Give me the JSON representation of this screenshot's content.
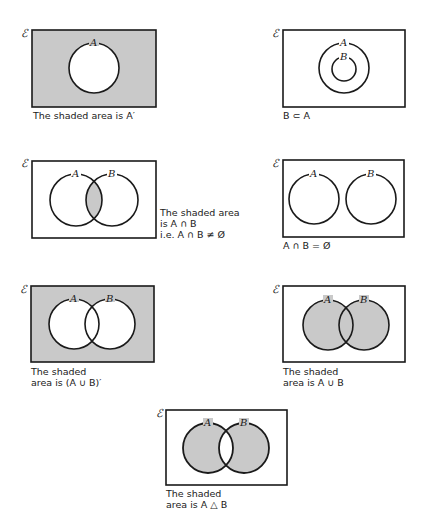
{
  "universal_symbol": "ℰ",
  "colors": {
    "shade": "#c9c9c9",
    "line": "#1a1a1a",
    "background": "#ffffff"
  },
  "diagrams": [
    {
      "id": "complement-A",
      "set_labels": [
        "A"
      ],
      "caption_lines": [
        "The shaded area is A′"
      ]
    },
    {
      "id": "B-subset-A",
      "set_labels": [
        "A",
        "B"
      ],
      "caption_lines": [
        "B ⊂ A"
      ]
    },
    {
      "id": "intersection",
      "set_labels": [
        "A",
        "B"
      ],
      "caption_lines": [
        "The shaded area",
        "is  A ∩ B",
        "i.e.  A ∩ B ≠ Ø"
      ]
    },
    {
      "id": "disjoint",
      "set_labels": [
        "A",
        "B"
      ],
      "caption_lines": [
        "A ∩ B = Ø"
      ]
    },
    {
      "id": "complement-union",
      "set_labels": [
        "A",
        "B"
      ],
      "caption_lines": [
        "The shaded",
        "area is (A ∪ B)′"
      ]
    },
    {
      "id": "union",
      "set_labels": [
        "A",
        "B"
      ],
      "caption_lines": [
        "The shaded",
        "area is  A ∪ B"
      ]
    },
    {
      "id": "symmetric-difference",
      "set_labels": [
        "A",
        "B"
      ],
      "caption_lines": [
        "The shaded",
        "area is  A △ B"
      ]
    }
  ]
}
